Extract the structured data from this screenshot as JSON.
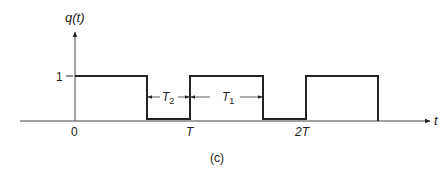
{
  "figure": {
    "y_axis_label": "q(t)",
    "x_axis_label": "t",
    "y_tick_label": "1",
    "x_ticks": [
      {
        "label": "0"
      },
      {
        "label": "T"
      },
      {
        "label": "2T"
      }
    ],
    "interval_labels": {
      "t2_main": "T",
      "t2_sub": "2",
      "t1_main": "T",
      "t1_sub": "1"
    },
    "caption": "(c)",
    "colors": {
      "stroke": "#222222",
      "background": "#ffffff"
    }
  }
}
